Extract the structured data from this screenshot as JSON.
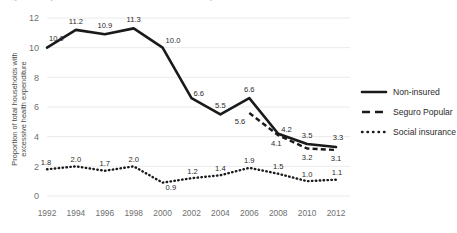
{
  "title_cropped": "Figure 1. Proportion of households with excessive health expenditure",
  "axes": {
    "ylabel_line1": "Proportion of total households with",
    "ylabel_line2": "excessive health expenditure",
    "yticks": [
      "0",
      "2",
      "4",
      "6",
      "8",
      "10",
      "12"
    ],
    "xticks": [
      "1992",
      "1994",
      "1996",
      "1998",
      "2000",
      "2002",
      "2004",
      "2006",
      "2008",
      "2010",
      "2012"
    ]
  },
  "legend": {
    "items": [
      {
        "label": "Non-insured",
        "style": "solid",
        "color": "#1a1a1a"
      },
      {
        "label": "Seguro Popular",
        "style": "dashed",
        "color": "#1a1a1a"
      },
      {
        "label": "Social insurance",
        "style": "dotted",
        "color": "#1a1a1a"
      }
    ]
  },
  "chart_data": {
    "type": "line",
    "title": "Proportion of households with excessive health expenditure",
    "xlabel": "",
    "ylabel": "Proportion of total households with excessive health expenditure",
    "xlim": [
      1992,
      2012
    ],
    "ylim": [
      0,
      12
    ],
    "grid": true,
    "legend_position": "right",
    "x": [
      1992,
      1994,
      1996,
      1998,
      2000,
      2002,
      2004,
      2006,
      2008,
      2010,
      2012
    ],
    "series": [
      {
        "name": "Non-insured",
        "style": "solid",
        "values": [
          10.0,
          11.2,
          10.9,
          11.3,
          10.0,
          6.6,
          5.5,
          6.6,
          4.2,
          3.5,
          3.3
        ],
        "labels": [
          "10.0",
          "11.2",
          "10.9",
          "11.3",
          "10.0",
          "6.6",
          "5.5",
          "6.6",
          "4.2",
          "3.5",
          "3.3"
        ]
      },
      {
        "name": "Seguro Popular",
        "style": "dashed",
        "x": [
          2006,
          2008,
          2010,
          2012
        ],
        "values": [
          5.6,
          4.1,
          3.2,
          3.1
        ],
        "labels": [
          "5.6",
          "4.1",
          "3.2",
          "3.1"
        ]
      },
      {
        "name": "Social insurance",
        "style": "dotted",
        "values": [
          1.8,
          2.0,
          1.7,
          2.0,
          0.9,
          1.2,
          1.4,
          1.9,
          1.5,
          1.0,
          1.1
        ],
        "labels": [
          "1.8",
          "2.0",
          "1.7",
          "2.0",
          "0.9",
          "1.2",
          "1.4",
          "1.9",
          "1.5",
          "1.0",
          "1.1"
        ]
      }
    ]
  }
}
